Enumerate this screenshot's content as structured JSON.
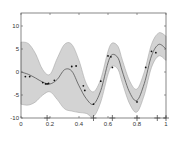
{
  "chart_data": {
    "type": "line",
    "title": "",
    "xlabel": "",
    "ylabel": "",
    "xlim": [
      0,
      1
    ],
    "ylim": [
      -10,
      12.8
    ],
    "x_ticks": [
      0,
      0.2,
      0.4,
      0.6,
      0.8,
      1
    ],
    "x_tick_labels": [
      "0",
      "0.2",
      "0.4",
      "0.6",
      "0.8",
      "1"
    ],
    "y_ticks": [
      -10,
      -5,
      0,
      5,
      10
    ],
    "y_tick_labels": [
      "-10",
      "-5",
      "0",
      "5",
      "10"
    ],
    "grid": false,
    "legend": null,
    "series": [
      {
        "name": "mean",
        "kind": "line",
        "color": "#555555",
        "x": [
          0,
          0.05,
          0.1,
          0.15,
          0.2,
          0.25,
          0.3,
          0.35,
          0.4,
          0.45,
          0.5,
          0.55,
          0.6,
          0.63,
          0.67,
          0.7,
          0.75,
          0.8,
          0.85,
          0.9,
          0.95,
          1.0
        ],
        "values": [
          0,
          -0.5,
          -1.3,
          -2.2,
          -2.6,
          -1.6,
          0.5,
          0.2,
          -3.0,
          -5.8,
          -7.0,
          -4.0,
          2.0,
          3.8,
          3.0,
          0.0,
          -4.5,
          -6.2,
          -2.5,
          3.5,
          6.0,
          5.0
        ]
      },
      {
        "name": "upper",
        "kind": "band-upper",
        "color": "#d3d3d3",
        "x": [
          0,
          0.05,
          0.1,
          0.15,
          0.2,
          0.25,
          0.3,
          0.35,
          0.4,
          0.45,
          0.5,
          0.55,
          0.6,
          0.63,
          0.67,
          0.7,
          0.75,
          0.8,
          0.85,
          0.9,
          0.95,
          1.0
        ],
        "values": [
          6.5,
          6.2,
          4.0,
          0.5,
          -0.5,
          3.0,
          6.0,
          6.0,
          2.5,
          -2.5,
          -4.3,
          -1.5,
          4.5,
          6.3,
          5.5,
          2.5,
          -2.0,
          -3.7,
          0.0,
          6.0,
          8.5,
          7.8
        ]
      },
      {
        "name": "lower",
        "kind": "band-lower",
        "color": "#d3d3d3",
        "x": [
          0,
          0.05,
          0.1,
          0.15,
          0.2,
          0.25,
          0.3,
          0.35,
          0.4,
          0.45,
          0.5,
          0.55,
          0.6,
          0.63,
          0.67,
          0.7,
          0.75,
          0.8,
          0.85,
          0.9,
          0.95,
          1.0
        ],
        "values": [
          -7.0,
          -7.2,
          -6.5,
          -5.0,
          -4.3,
          -6.0,
          -8.0,
          -8.5,
          -8.8,
          -9.0,
          -9.7,
          -6.5,
          -0.5,
          1.3,
          0.5,
          -2.5,
          -7.0,
          -8.7,
          -5.0,
          1.0,
          3.5,
          2.5
        ]
      },
      {
        "name": "observations",
        "kind": "scatter",
        "color": "#111111",
        "x": [
          0.03,
          0.06,
          0.15,
          0.17,
          0.18,
          0.19,
          0.23,
          0.35,
          0.38,
          0.43,
          0.44,
          0.5,
          0.55,
          0.6,
          0.62,
          0.63,
          0.8,
          0.86,
          0.9,
          0.93
        ],
        "values": [
          -1.0,
          -1.0,
          -2.3,
          -2.6,
          -2.6,
          -2.5,
          -1.8,
          1.2,
          1.3,
          -3.0,
          -4.0,
          -7.0,
          -2.0,
          3.5,
          3.3,
          1.0,
          -6.5,
          1.0,
          4.5,
          4.2
        ]
      },
      {
        "name": "inducing_inputs",
        "kind": "marker-plus",
        "color": "#333333",
        "x": [
          0.18,
          0.5,
          0.63,
          0.8,
          0.94,
          1.0
        ],
        "values": [
          -10,
          -10,
          -10,
          -10,
          -10,
          -10
        ]
      }
    ]
  }
}
